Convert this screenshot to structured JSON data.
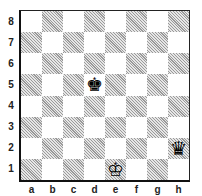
{
  "diagram": {
    "type": "chess-position",
    "orientation": "white-bottom",
    "colors": {
      "light_square": "#ffffff",
      "dark_square": "hatched-gray",
      "border": "#111111"
    },
    "ranks": [
      "8",
      "7",
      "6",
      "5",
      "4",
      "3",
      "2",
      "1"
    ],
    "files": [
      "a",
      "b",
      "c",
      "d",
      "e",
      "f",
      "g",
      "h"
    ],
    "pieces": [
      {
        "square": "d5",
        "color": "black",
        "type": "king",
        "glyph": "♚"
      },
      {
        "square": "e1",
        "color": "white",
        "type": "king",
        "glyph": "♔"
      },
      {
        "square": "h2",
        "color": "black",
        "type": "queen",
        "glyph": "♛"
      }
    ]
  }
}
